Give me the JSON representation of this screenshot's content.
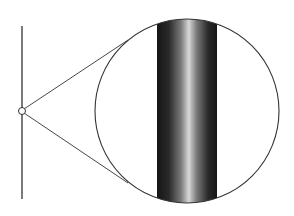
{
  "diagram": {
    "colors": {
      "background": "#ffffff",
      "stroke": "#333333",
      "band_dark": "#151515",
      "band_mid": "#6a6a6a",
      "band_light": "#d8d8d8"
    },
    "wire_line": {
      "x": 22,
      "y1": 26,
      "y2": 199
    },
    "focus_point": {
      "cx": 22,
      "cy": 111,
      "r": 3.5
    },
    "magnifier": {
      "cx": 187,
      "cy": 111,
      "r": 92
    },
    "callout_lines": [
      {
        "x1": 24,
        "y1": 109,
        "x2": 128,
        "y2": 40
      },
      {
        "x1": 24,
        "y1": 113,
        "x2": 128,
        "y2": 183
      }
    ],
    "magnified_band": {
      "x": 157,
      "width": 60
    }
  }
}
